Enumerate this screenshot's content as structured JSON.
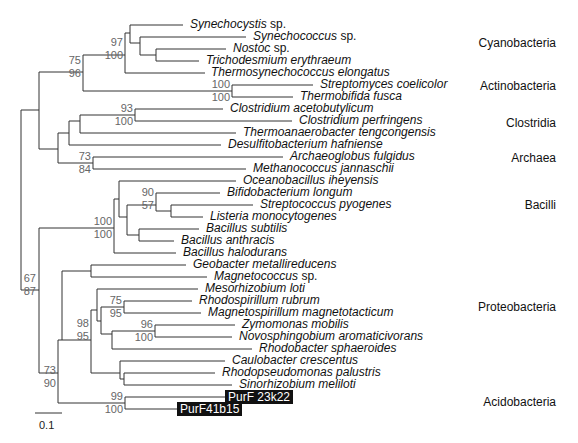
{
  "figure": {
    "type": "phylogenetic-tree",
    "scale_bar": {
      "label": "0.1"
    },
    "groups": [
      {
        "name": "Cyanobacteria",
        "y": 43
      },
      {
        "name": "Actinobacteria",
        "y": 86
      },
      {
        "name": "Clostridia",
        "y": 123
      },
      {
        "name": "Archaea",
        "y": 158
      },
      {
        "name": "Bacilli",
        "y": 205
      },
      {
        "name": "Proteobacteria",
        "y": 307
      },
      {
        "name": "Acidobacteria",
        "y": 402
      }
    ],
    "taxa": [
      {
        "genus": "Synechocystis",
        "suffix": " sp.",
        "y": 25,
        "x": 187
      },
      {
        "genus": "Synechococcus",
        "suffix": " sp.",
        "y": 37,
        "x": 250
      },
      {
        "genus": "Nostoc",
        "suffix": " sp.",
        "y": 49,
        "x": 230
      },
      {
        "genus": "Trichodesmium erythraeum",
        "suffix": "",
        "y": 61,
        "x": 203
      },
      {
        "genus": "Thermosynechococcus elongatus",
        "suffix": "",
        "y": 73,
        "x": 208
      },
      {
        "genus": "Streptomyces coelicolor",
        "suffix": "",
        "y": 85,
        "x": 317
      },
      {
        "genus": "Thermobifida fusca",
        "suffix": "",
        "y": 97,
        "x": 297
      },
      {
        "genus": "Clostridium acetobutylicum",
        "suffix": "",
        "y": 109,
        "x": 227
      },
      {
        "genus": "Clostridium perfringens",
        "suffix": "",
        "y": 121,
        "x": 296
      },
      {
        "genus": "Thermoanaerobacter tengcongensis",
        "suffix": "",
        "y": 133,
        "x": 240
      },
      {
        "genus": "Desulfitobacterium hafniense",
        "suffix": "",
        "y": 145,
        "x": 225
      },
      {
        "genus": "Archaeoglobus fulgidus",
        "suffix": "",
        "y": 157,
        "x": 287
      },
      {
        "genus": "Methanococcus jannaschii",
        "suffix": "",
        "y": 169,
        "x": 250
      },
      {
        "genus": "Oceanobacillus iheyensis",
        "suffix": "",
        "y": 181,
        "x": 240
      },
      {
        "genus": "Bifidobacterium longum",
        "suffix": "",
        "y": 193,
        "x": 224
      },
      {
        "genus": "Streptococcus pyogenes",
        "suffix": "",
        "y": 205,
        "x": 257
      },
      {
        "genus": "Listeria monocytogenes",
        "suffix": "",
        "y": 217,
        "x": 207
      },
      {
        "genus": "Bacillus subtilis",
        "suffix": "",
        "y": 229,
        "x": 203
      },
      {
        "genus": "Bacillus anthracis",
        "suffix": "",
        "y": 241,
        "x": 178
      },
      {
        "genus": "Bacillus halodurans",
        "suffix": "",
        "y": 253,
        "x": 180
      },
      {
        "genus": "Geobacter metallireducens",
        "suffix": "",
        "y": 265,
        "x": 190
      },
      {
        "genus": "Magnetococcus",
        "suffix": " sp.",
        "y": 277,
        "x": 211
      },
      {
        "genus": "Mesorhizobium loti",
        "suffix": "",
        "y": 289,
        "x": 202
      },
      {
        "genus": "Rhodospirillum rubrum",
        "suffix": "",
        "y": 301,
        "x": 196
      },
      {
        "genus": "Magnetospirillum magnetotacticum",
        "suffix": "",
        "y": 313,
        "x": 205
      },
      {
        "genus": "Zymomonas mobilis",
        "suffix": "",
        "y": 325,
        "x": 239
      },
      {
        "genus": "Novosphingobium aromaticivorans",
        "suffix": "",
        "y": 337,
        "x": 236
      },
      {
        "genus": "Rhodobacter sphaeroides",
        "suffix": "",
        "y": 349,
        "x": 256
      },
      {
        "genus": "Caulobacter crescentus",
        "suffix": "",
        "y": 361,
        "x": 229
      },
      {
        "genus": "Rhodopseudomonas palustris",
        "suffix": "",
        "y": 373,
        "x": 219
      },
      {
        "genus": "Sinorhizobium meliloti",
        "suffix": "",
        "y": 385,
        "x": 236
      }
    ],
    "highlighted_taxa": [
      {
        "label": "PurF 23k22",
        "y": 397,
        "x": 225
      },
      {
        "label": "PurF41b15",
        "y": 409,
        "x": 177
      }
    ],
    "bootstrap": [
      {
        "top": "97",
        "bottom": "100",
        "x": 125,
        "y": 49
      },
      {
        "top": "75",
        "bottom": "96",
        "x": 83,
        "y": 67
      },
      {
        "top": "100",
        "bottom": "100",
        "x": 232,
        "y": 91
      },
      {
        "top": "93",
        "bottom": "100",
        "x": 135,
        "y": 115
      },
      {
        "top": "73",
        "bottom": "84",
        "x": 93,
        "y": 163
      },
      {
        "top": "90",
        "bottom": "57",
        "x": 156,
        "y": 199
      },
      {
        "top": "100",
        "bottom": "100",
        "x": 114,
        "y": 228
      },
      {
        "top": "67",
        "bottom": "87",
        "x": 38,
        "y": 285
      },
      {
        "top": "75",
        "bottom": "95",
        "x": 124,
        "y": 307
      },
      {
        "top": "96",
        "bottom": "100",
        "x": 155,
        "y": 331
      },
      {
        "top": "98",
        "bottom": "95",
        "x": 91,
        "y": 330
      },
      {
        "top": "73",
        "bottom": "90",
        "x": 58,
        "y": 377
      },
      {
        "top": "99",
        "bottom": "100",
        "x": 125,
        "y": 403
      }
    ]
  }
}
